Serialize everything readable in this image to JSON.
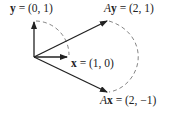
{
  "diagram": {
    "vectors": [
      {
        "id": "y",
        "name": "y",
        "value": "(0, 1)",
        "label_prefix": "",
        "label_vec": "y",
        "label_rest": " = (0, 1)"
      },
      {
        "id": "x",
        "name": "x",
        "value": "(1, 0)",
        "label_prefix": "",
        "label_vec": "x",
        "label_rest": " = (1, 0)"
      },
      {
        "id": "Ay",
        "name": "Ay",
        "value": "(2, 1)",
        "label_prefix": "A",
        "label_vec": "y",
        "label_rest": " = (2, 1)"
      },
      {
        "id": "Ax",
        "name": "Ax",
        "value": "(2, −1)",
        "label_prefix": "A",
        "label_vec": "x",
        "label_rest": " = (2, −1)"
      }
    ],
    "colors": {
      "arrow": "#222222",
      "arc": "#666666",
      "text": "#222222"
    }
  }
}
